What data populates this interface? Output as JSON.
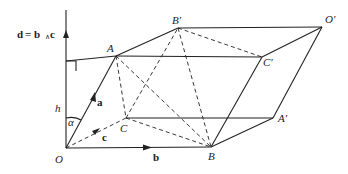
{
  "diagram": {
    "title_label": "d = b∧ c",
    "labels": {
      "O": "O",
      "A": "A",
      "B": "B",
      "C": "C",
      "A_prime": "A′",
      "B_prime": "B′",
      "C_prime": "C′",
      "O_prime": "O′",
      "h": "h",
      "alpha": "α",
      "vec_a": "a",
      "vec_b": "b",
      "vec_c": "c",
      "d_label": "d",
      "eq_label": "= b",
      "wedge": "∧",
      "c_label": "c"
    },
    "points": {
      "O": [
        66,
        148
      ],
      "A": [
        116,
        56
      ],
      "B": [
        211,
        147
      ],
      "C": [
        126,
        118
      ],
      "B_prime": [
        178,
        28
      ],
      "C_prime": [
        262,
        57
      ],
      "O_prime": [
        322,
        27
      ],
      "A_prime": [
        273,
        118
      ]
    },
    "colors": {
      "stroke": "#222222",
      "background": "#ffffff"
    }
  }
}
